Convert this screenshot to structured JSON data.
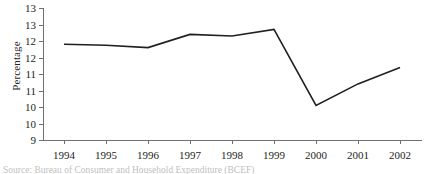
{
  "figure": {
    "caption": "Source: Bureau of Consumer and Household Expenditure (BCEF)"
  },
  "chart_data": {
    "type": "line",
    "title": "",
    "xlabel": "",
    "ylabel": "Percentage",
    "categories": [
      "1994",
      "1995",
      "1996",
      "1997",
      "1998",
      "1999",
      "2000",
      "2001",
      "2002"
    ],
    "values": [
      11.9,
      11.87,
      11.8,
      12.2,
      12.15,
      12.35,
      10.05,
      10.7,
      11.2
    ],
    "series": [
      {
        "name": "Percentage",
        "values": [
          11.9,
          11.87,
          11.8,
          12.2,
          12.15,
          12.35,
          10.05,
          10.7,
          11.2
        ]
      }
    ],
    "ylim": [
      9,
      13
    ],
    "ytick_values": [
      13,
      12.5,
      12,
      11.5,
      11,
      10.5,
      10,
      9.5,
      9
    ],
    "ytick_labels": [
      "13",
      "13",
      "12",
      "12",
      "11",
      "11",
      "10",
      "10",
      "9"
    ],
    "xtick_labels": [
      "1994",
      "1995",
      "1996",
      "1997",
      "1998",
      "1999",
      "2000",
      "2001",
      "2002"
    ],
    "grid": false,
    "legend": "none",
    "line_color": "#231f20",
    "axis_color": "#6f6f6f"
  }
}
